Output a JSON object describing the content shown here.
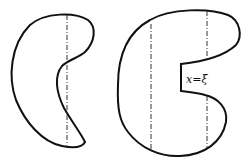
{
  "diagram": {
    "left_region": {
      "description": "simply connected region, vertical line meets boundary in two points"
    },
    "right_region": {
      "description": "region with notch; vertical lines cut boundary",
      "notch_label": "x=ξ"
    }
  }
}
